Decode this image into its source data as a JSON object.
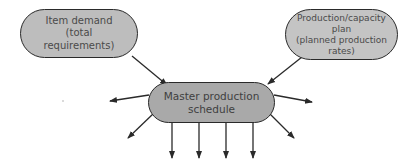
{
  "diagram": {
    "type": "flow",
    "colors": {
      "input_node_fill": "#bdbdbd",
      "center_node_fill": "#a9a9a9",
      "stroke": "#2a2a2a",
      "text": "#4a4a4a"
    },
    "nodes": [
      {
        "id": "item-demand",
        "label": "Item demand\n(total\nrequirements)",
        "role": "input"
      },
      {
        "id": "production-capacity-plan",
        "label": "Production/capacity\nplan\n(planned production\nrates)",
        "role": "input"
      },
      {
        "id": "master-production-schedule",
        "label": "Master production\nschedule",
        "role": "central"
      }
    ],
    "edges": [
      {
        "from": "item-demand",
        "to": "master-production-schedule"
      },
      {
        "from": "production-capacity-plan",
        "to": "master-production-schedule"
      }
    ],
    "output_arrows": {
      "count": 8,
      "directions": [
        "left",
        "lower-left",
        "down",
        "down",
        "down",
        "down",
        "lower-right",
        "right"
      ],
      "labels": []
    }
  }
}
